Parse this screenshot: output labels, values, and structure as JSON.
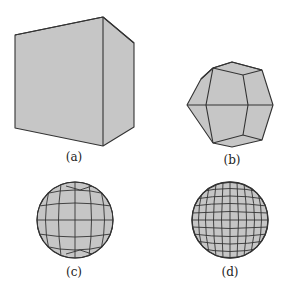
{
  "figure": {
    "panels": [
      {
        "id": "a",
        "label": "(a)",
        "shape": "cube"
      },
      {
        "id": "b",
        "label": "(b)",
        "shape": "subdivided-cube-level-1"
      },
      {
        "id": "c",
        "label": "(c)",
        "shape": "subdivided-cube-level-2"
      },
      {
        "id": "d",
        "label": "(d)",
        "shape": "subdivided-cube-level-3"
      }
    ],
    "colors": {
      "fill": "#c6c6c6",
      "stroke": "#333333",
      "background": "#ffffff"
    }
  }
}
